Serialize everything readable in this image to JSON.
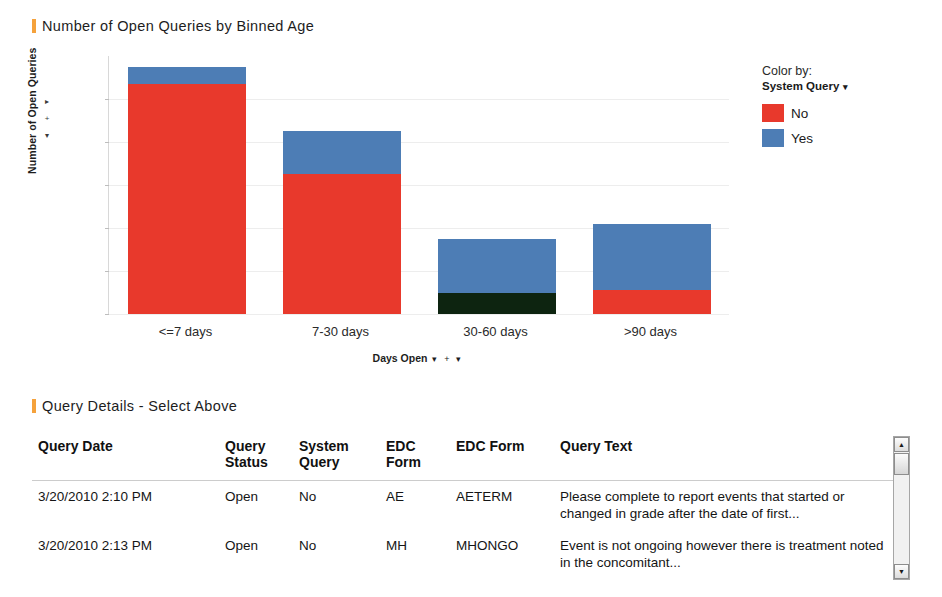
{
  "chart_section": {
    "title": "Number of Open Queries by Binned Age"
  },
  "table_section": {
    "title": "Query Details - Select Above"
  },
  "axis": {
    "y_title": "Number of Open Queries",
    "x_title": "Days Open",
    "y_up_icon": "▸",
    "y_plus_icon": "+",
    "y_down_icon": "▾",
    "x_caret_icon": "▾",
    "x_plus_icon": "+",
    "x_caret2_icon": "▾"
  },
  "legend": {
    "caption": "Color by:",
    "field": "System Query",
    "caret_icon": "▾",
    "items": [
      {
        "label": "No",
        "color": "#e8392c"
      },
      {
        "label": "Yes",
        "color": "#4d7db5"
      }
    ]
  },
  "colors": {
    "no": "#e8392c",
    "yes": "#4d7db5",
    "selected": "#0d2410",
    "accent": "#f5a23c"
  },
  "chart_data": {
    "type": "bar",
    "stacked": true,
    "title": "Number of Open Queries by Binned Age",
    "xlabel": "Days Open",
    "ylabel": "Number of Open Queries",
    "categories": [
      "<=7 days",
      "7-30 days",
      "30-60 days",
      ">90 days"
    ],
    "yticks": [
      0,
      20,
      40,
      60,
      80,
      100
    ],
    "ylim": [
      0,
      120
    ],
    "grid": true,
    "legend_position": "right",
    "series": [
      {
        "name": "No",
        "color": "#e8392c",
        "values": [
          107,
          65,
          0,
          11
        ]
      },
      {
        "name": "Yes",
        "color": "#4d7db5",
        "values": [
          8,
          20,
          25,
          31
        ]
      }
    ],
    "selected_segments": [
      {
        "category": "30-60 days",
        "series": "No",
        "value": 10,
        "color": "#0d2410"
      }
    ],
    "totals": [
      115,
      85,
      35,
      42
    ]
  },
  "table": {
    "columns": [
      "Query Date",
      "Query Status",
      "System Query",
      "EDC Form",
      "EDC Form",
      "Query Text"
    ],
    "rows": [
      {
        "query_date": "3/20/2010 2:10 PM",
        "query_status": "Open",
        "system_query": "No",
        "edc_form_1": "AE",
        "edc_form_2": "AETERM",
        "query_text": "Please complete to report events that started or changed in grade after the date of first..."
      },
      {
        "query_date": "3/20/2010 2:13 PM",
        "query_status": "Open",
        "system_query": "No",
        "edc_form_1": "MH",
        "edc_form_2": "MHONGO",
        "query_text": "Event is not ongoing however there is treatment noted in the concomitant..."
      }
    ],
    "scrollbar": {
      "up_icon": "▲",
      "down_icon": "▼"
    }
  }
}
